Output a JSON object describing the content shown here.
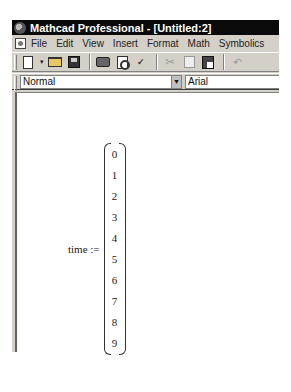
{
  "window": {
    "title": "Mathcad Professional - [Untitled:2]",
    "app_icon": "mathcad-app-icon"
  },
  "menubar": {
    "doc_icon": "document-icon",
    "items": [
      {
        "label": "File",
        "mnemonic": "F"
      },
      {
        "label": "Edit",
        "mnemonic": "E"
      },
      {
        "label": "View",
        "mnemonic": "V"
      },
      {
        "label": "Insert",
        "mnemonic": "I"
      },
      {
        "label": "Format",
        "mnemonic": "o"
      },
      {
        "label": "Math",
        "mnemonic": "M"
      },
      {
        "label": "Symbolics",
        "mnemonic": "S"
      }
    ]
  },
  "toolbar": {
    "buttons": [
      "new-icon",
      "new-dropdown-icon",
      "open-icon",
      "save-icon",
      "print-icon",
      "print-preview-icon",
      "spell-check-icon",
      "cut-icon",
      "copy-icon",
      "paste-icon",
      "undo-icon"
    ],
    "new_dropdown_glyph": "▾",
    "spell_glyph": "ABC✓",
    "cut_glyph": "✂",
    "undo_glyph": "↶"
  },
  "formatbar": {
    "style_value": "Normal",
    "dropdown_glyph": "▼",
    "font_value": "Arial"
  },
  "worksheet": {
    "expression": {
      "variable": "time",
      "operator": ":=",
      "label": "time :=",
      "vector": [
        "0",
        "1",
        "2",
        "3",
        "4",
        "5",
        "6",
        "7",
        "8",
        "9"
      ]
    }
  }
}
